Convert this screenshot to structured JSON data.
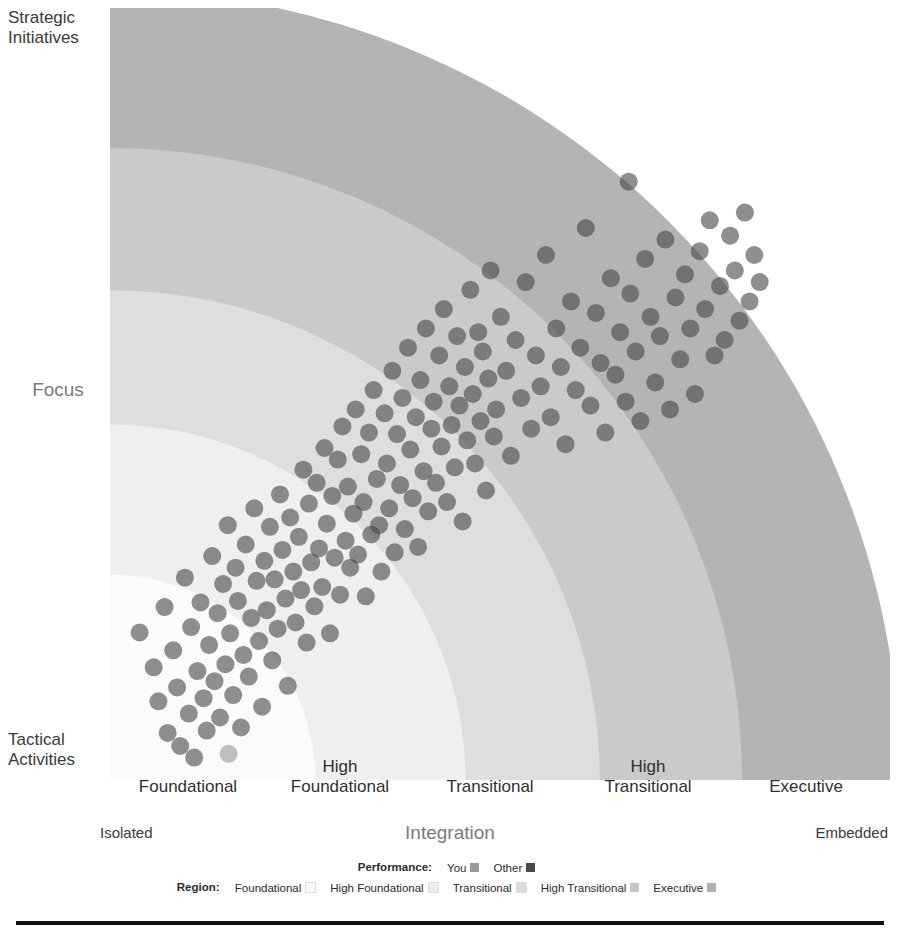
{
  "yAxis": {
    "title": "Focus",
    "top_anchor": "Strategic\nInitiatives",
    "bottom_anchor": "Tactical\nActivities"
  },
  "xAxis": {
    "title": "Integration",
    "left_anchor": "Isolated",
    "right_anchor": "Embedded"
  },
  "regions": [
    {
      "label": "Foundational",
      "color": "#fbfbfb"
    },
    {
      "label": "High\nFoundational",
      "color": "#efefef"
    },
    {
      "label": "Transitional",
      "color": "#dedede"
    },
    {
      "label": "High\nTransitional",
      "color": "#cacaca"
    },
    {
      "label": "Executive",
      "color": "#b4b4b4"
    }
  ],
  "legend": {
    "performance": {
      "title": "Performance:",
      "entries": [
        {
          "label": "You",
          "color": "#9a9a9c"
        },
        {
          "label": "Other",
          "color": "#4a4a4c"
        }
      ]
    },
    "region": {
      "title": "Region:",
      "entries": [
        {
          "label": "Foundational",
          "color": "#fdfdfd"
        },
        {
          "label": "High Foundational",
          "color": "#ededed"
        },
        {
          "label": "Transitional",
          "color": "#dcdcdc"
        },
        {
          "label": "High Transitional",
          "color": "#c6c6c6"
        },
        {
          "label": "Executive",
          "color": "#b0b0b0"
        }
      ]
    }
  },
  "chart_data": {
    "type": "scatter",
    "title": "",
    "xlabel": "Integration",
    "ylabel": "Focus",
    "xlim": [
      0,
      100
    ],
    "ylim": [
      0,
      100
    ],
    "grid": false,
    "legend_position": "bottom",
    "coordinate_system": "radial-quadrant",
    "annotations": [
      "Concentric maturity bands radiate from the lower-left origin.",
      "Band order outward: Foundational, High Foundational, Transitional, High Transitional, Executive."
    ],
    "band_radii_pct": [
      26,
      45,
      62,
      80,
      100
    ],
    "dot_radius_px": 9,
    "dot_opacity": 0.62,
    "series": [
      {
        "name": "Other",
        "color": "#4a4a4c",
        "count": 181,
        "points": [
          [
            3.8,
            19.1
          ],
          [
            5.6,
            14.6
          ],
          [
            6.2,
            10.2
          ],
          [
            7.0,
            22.4
          ],
          [
            7.4,
            6.1
          ],
          [
            8.1,
            16.8
          ],
          [
            8.6,
            12.0
          ],
          [
            9.0,
            4.4
          ],
          [
            9.6,
            26.2
          ],
          [
            10.1,
            8.6
          ],
          [
            10.4,
            19.8
          ],
          [
            10.8,
            2.9
          ],
          [
            11.2,
            14.1
          ],
          [
            11.6,
            23.0
          ],
          [
            12.0,
            10.6
          ],
          [
            12.4,
            6.4
          ],
          [
            12.7,
            17.5
          ],
          [
            13.1,
            29.0
          ],
          [
            13.4,
            12.8
          ],
          [
            13.8,
            21.6
          ],
          [
            14.1,
            8.1
          ],
          [
            14.5,
            25.4
          ],
          [
            14.8,
            15.0
          ],
          [
            15.1,
            33.0
          ],
          [
            15.4,
            19.0
          ],
          [
            15.8,
            11.0
          ],
          [
            16.1,
            27.5
          ],
          [
            16.4,
            23.2
          ],
          [
            16.8,
            6.8
          ],
          [
            17.1,
            16.2
          ],
          [
            17.4,
            30.5
          ],
          [
            17.8,
            13.4
          ],
          [
            18.1,
            21.0
          ],
          [
            18.5,
            35.2
          ],
          [
            18.8,
            25.8
          ],
          [
            19.1,
            18.0
          ],
          [
            19.5,
            9.5
          ],
          [
            19.8,
            28.4
          ],
          [
            20.1,
            22.0
          ],
          [
            20.5,
            32.8
          ],
          [
            20.8,
            15.5
          ],
          [
            21.1,
            26.0
          ],
          [
            21.5,
            19.6
          ],
          [
            21.8,
            37.0
          ],
          [
            22.1,
            29.8
          ],
          [
            22.5,
            23.5
          ],
          [
            22.8,
            12.2
          ],
          [
            23.1,
            34.0
          ],
          [
            23.5,
            27.0
          ],
          [
            23.8,
            20.4
          ],
          [
            24.2,
            31.5
          ],
          [
            24.5,
            24.6
          ],
          [
            24.8,
            40.2
          ],
          [
            25.2,
            17.8
          ],
          [
            25.5,
            35.8
          ],
          [
            25.8,
            28.2
          ],
          [
            26.2,
            22.5
          ],
          [
            26.5,
            38.5
          ],
          [
            26.8,
            30.0
          ],
          [
            27.2,
            25.0
          ],
          [
            27.5,
            43.0
          ],
          [
            27.8,
            33.2
          ],
          [
            28.2,
            19.0
          ],
          [
            28.5,
            36.8
          ],
          [
            28.8,
            28.8
          ],
          [
            29.2,
            41.5
          ],
          [
            29.5,
            24.0
          ],
          [
            29.8,
            45.8
          ],
          [
            30.2,
            31.0
          ],
          [
            30.5,
            38.0
          ],
          [
            30.8,
            27.5
          ],
          [
            31.2,
            34.5
          ],
          [
            31.5,
            48.0
          ],
          [
            31.8,
            29.2
          ],
          [
            32.2,
            42.2
          ],
          [
            32.5,
            36.0
          ],
          [
            32.8,
            23.8
          ],
          [
            33.2,
            45.0
          ],
          [
            33.5,
            31.8
          ],
          [
            33.8,
            50.5
          ],
          [
            34.2,
            39.0
          ],
          [
            34.5,
            33.0
          ],
          [
            34.8,
            27.0
          ],
          [
            35.2,
            47.5
          ],
          [
            35.5,
            41.0
          ],
          [
            35.8,
            35.2
          ],
          [
            36.2,
            53.0
          ],
          [
            36.5,
            29.5
          ],
          [
            36.8,
            44.8
          ],
          [
            37.2,
            38.2
          ],
          [
            37.5,
            49.5
          ],
          [
            37.8,
            32.5
          ],
          [
            38.2,
            56.0
          ],
          [
            38.5,
            42.8
          ],
          [
            38.8,
            36.5
          ],
          [
            39.2,
            47.0
          ],
          [
            39.5,
            30.2
          ],
          [
            39.8,
            51.8
          ],
          [
            40.2,
            40.0
          ],
          [
            40.5,
            58.5
          ],
          [
            40.8,
            34.8
          ],
          [
            41.2,
            45.5
          ],
          [
            41.5,
            49.0
          ],
          [
            41.8,
            38.5
          ],
          [
            42.2,
            55.0
          ],
          [
            42.5,
            43.2
          ],
          [
            42.8,
            61.0
          ],
          [
            43.2,
            36.0
          ],
          [
            43.5,
            51.0
          ],
          [
            43.8,
            46.0
          ],
          [
            44.2,
            40.5
          ],
          [
            44.5,
            57.5
          ],
          [
            44.8,
            48.5
          ],
          [
            45.2,
            33.5
          ],
          [
            45.5,
            53.5
          ],
          [
            45.8,
            44.0
          ],
          [
            46.2,
            63.5
          ],
          [
            46.5,
            50.0
          ],
          [
            46.8,
            41.0
          ],
          [
            47.2,
            58.0
          ],
          [
            47.5,
            46.5
          ],
          [
            47.8,
            55.5
          ],
          [
            48.2,
            37.5
          ],
          [
            48.5,
            52.0
          ],
          [
            48.8,
            66.0
          ],
          [
            49.2,
            44.5
          ],
          [
            49.5,
            48.0
          ],
          [
            50.1,
            60.0
          ],
          [
            50.8,
            53.0
          ],
          [
            51.4,
            42.0
          ],
          [
            52.0,
            57.0
          ],
          [
            52.7,
            49.5
          ],
          [
            53.3,
            64.5
          ],
          [
            54.0,
            45.5
          ],
          [
            54.6,
            55.0
          ],
          [
            55.2,
            51.0
          ],
          [
            55.9,
            68.0
          ],
          [
            56.5,
            47.0
          ],
          [
            57.2,
            58.5
          ],
          [
            57.8,
            53.5
          ],
          [
            58.4,
            43.5
          ],
          [
            59.1,
            62.0
          ],
          [
            59.7,
            50.5
          ],
          [
            60.3,
            56.0
          ],
          [
            61.0,
            71.5
          ],
          [
            61.6,
            48.5
          ],
          [
            62.3,
            60.5
          ],
          [
            62.9,
            54.0
          ],
          [
            63.5,
            45.0
          ],
          [
            64.2,
            65.0
          ],
          [
            64.8,
            52.5
          ],
          [
            65.4,
            58.0
          ],
          [
            66.1,
            49.0
          ],
          [
            66.7,
            63.0
          ],
          [
            67.4,
            55.5
          ],
          [
            68.0,
            46.5
          ],
          [
            68.6,
            67.5
          ],
          [
            69.3,
            60.0
          ],
          [
            69.9,
            51.5
          ],
          [
            70.5,
            57.5
          ],
          [
            71.2,
            70.0
          ],
          [
            71.8,
            48.0
          ],
          [
            72.5,
            62.5
          ],
          [
            73.1,
            54.5
          ],
          [
            73.7,
            65.5
          ],
          [
            74.4,
            58.5
          ],
          [
            75.0,
            50.0
          ],
          [
            75.6,
            68.5
          ],
          [
            76.3,
            61.0
          ],
          [
            76.9,
            72.5
          ],
          [
            77.5,
            55.0
          ],
          [
            78.2,
            64.0
          ],
          [
            78.8,
            57.0
          ],
          [
            79.5,
            70.5
          ],
          [
            80.1,
            66.0
          ],
          [
            80.7,
            59.5
          ],
          [
            81.4,
            73.5
          ],
          [
            82.0,
            62.0
          ],
          [
            82.6,
            68.0
          ],
          [
            83.3,
            64.5
          ],
          [
            66.5,
            77.5
          ]
        ]
      },
      {
        "name": "You",
        "color": "#9a9a9c",
        "count": 1,
        "points": [
          [
            15.2,
            3.4
          ]
        ]
      }
    ]
  }
}
